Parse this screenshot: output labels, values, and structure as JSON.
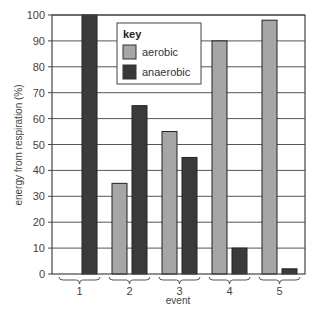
{
  "chart_data": {
    "type": "bar",
    "title": "",
    "xlabel": "event",
    "ylabel": "energy from respiration (%)",
    "ylim": [
      0,
      100
    ],
    "yticks": [
      0,
      10,
      20,
      30,
      40,
      50,
      60,
      70,
      80,
      90,
      100
    ],
    "grid": true,
    "categories": [
      "1",
      "2",
      "3",
      "4",
      "5"
    ],
    "series": [
      {
        "name": "aerobic",
        "color": "#a6a6a6",
        "values": [
          0,
          35,
          55,
          90,
          98
        ]
      },
      {
        "name": "anaerobic",
        "color": "#3a3a3a",
        "values": [
          100,
          65,
          45,
          10,
          2
        ]
      }
    ],
    "legend": {
      "title": "key",
      "position": "upper-left-inside",
      "entries": [
        "aerobic",
        "anaerobic"
      ]
    }
  }
}
